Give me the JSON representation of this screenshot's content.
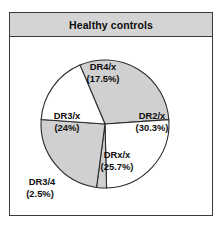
{
  "panel": {
    "title": "Healthy controls"
  },
  "chart_data": {
    "type": "pie",
    "title": "Healthy controls",
    "xlabel": "",
    "ylabel": "",
    "legend_position": "none",
    "grid": false,
    "unit": "%",
    "categories": [
      "DR2/x",
      "DRx/x",
      "DR3/4",
      "DR3/x",
      "DR4/x"
    ],
    "values": [
      30.3,
      25.7,
      2.5,
      24.0,
      17.5
    ],
    "slices": [
      {
        "name": "DR2/x",
        "label": "DR2/x",
        "value_label": "(30.3%)",
        "value": 30.3,
        "fill": "#d0d0d0",
        "label_x": 143,
        "label_y": 80,
        "value_x": 143,
        "value_y": 92,
        "label_inside": true
      },
      {
        "name": "DRx/x",
        "label": "DRx/x",
        "value_label": "(25.7%)",
        "value": 25.7,
        "fill": "#ffffff",
        "label_x": 108,
        "label_y": 119,
        "value_x": 108,
        "value_y": 131,
        "label_inside": true
      },
      {
        "name": "DR3/4",
        "label": "DR3/4",
        "value_label": "(2.5%)",
        "value": 2.5,
        "fill": "#d0d0d0",
        "label_x": 33,
        "label_y": 146,
        "value_x": 31,
        "value_y": 158,
        "label_inside": false
      },
      {
        "name": "DR3/x",
        "label": "DR3/x",
        "value_label": "(24%)",
        "value": 24.0,
        "fill": "#d0d0d0",
        "label_x": 58,
        "label_y": 80,
        "value_x": 58,
        "value_y": 92,
        "label_inside": true
      },
      {
        "name": "DR4/x",
        "label": "DR4/x",
        "value_label": "(17.5%)",
        "value": 17.5,
        "fill": "#ffffff",
        "label_x": 94,
        "label_y": 31,
        "value_x": 94,
        "value_y": 43,
        "label_inside": true
      }
    ],
    "geometry": {
      "center_x": 96,
      "center_y": 87,
      "radius": 64,
      "start_angle_deg": -23
    },
    "colors": {
      "slice_gray": "#d0d0d0",
      "slice_white": "#ffffff",
      "outline": "#2b2b2b",
      "title_bar": "#d4d4d4",
      "frame": "#3a3a3a",
      "text": "#0d0d0d"
    }
  }
}
